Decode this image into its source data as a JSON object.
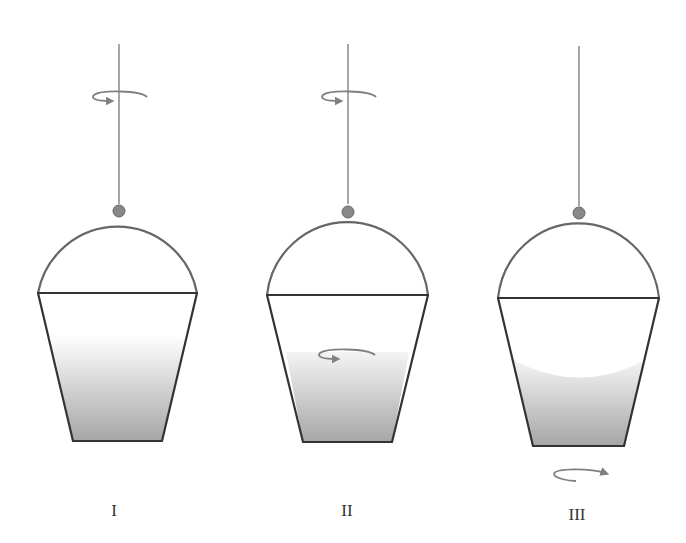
{
  "figure": {
    "panels": [
      {
        "label": "I",
        "rope_rotating": true,
        "water_rotating": false,
        "water_surface": "flat",
        "bucket_rotating_arrow_below": false
      },
      {
        "label": "II",
        "rope_rotating": true,
        "water_rotating": true,
        "water_surface": "flat",
        "bucket_rotating_arrow_below": false
      },
      {
        "label": "III",
        "rope_rotating": false,
        "water_rotating": false,
        "water_surface": "concave",
        "bucket_rotating_arrow_below": true
      }
    ]
  },
  "colors": {
    "rope": "#888888",
    "handle": "#666666",
    "knob": "#888888",
    "bucket_outline": "#333333",
    "water_top": "#ffffff",
    "water_bottom": "#a6a6a6",
    "arrow": "#808080",
    "label": "#333333"
  }
}
